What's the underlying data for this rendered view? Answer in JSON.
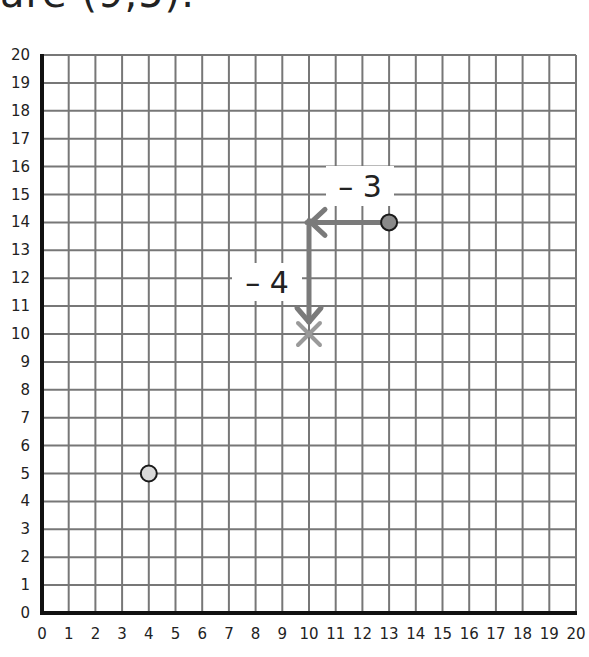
{
  "header": {
    "text": "are (9,5)."
  },
  "chart_data": {
    "type": "scatter",
    "title": "",
    "xlabel": "",
    "ylabel": "",
    "xlim": [
      0,
      20
    ],
    "ylim": [
      0,
      20
    ],
    "grid": true,
    "x_ticks": [
      "0",
      "1",
      "2",
      "3",
      "4",
      "5",
      "6",
      "7",
      "8",
      "9",
      "10",
      "11",
      "12",
      "13",
      "14",
      "15",
      "16",
      "17",
      "18",
      "19",
      "20"
    ],
    "y_ticks": [
      "0",
      "1",
      "2",
      "3",
      "4",
      "5",
      "6",
      "7",
      "8",
      "9",
      "10",
      "11",
      "12",
      "13",
      "14",
      "15",
      "16",
      "17",
      "18",
      "19",
      "20"
    ],
    "points": [
      {
        "name": "start-point",
        "x": 13,
        "y": 14,
        "color": "#8a8a8a"
      },
      {
        "name": "other-point",
        "x": 4,
        "y": 5,
        "color": "#d9d9d9"
      }
    ],
    "markers": [
      {
        "name": "result-cross",
        "x": 10,
        "y": 10,
        "symbol": "x",
        "color": "#9a9a9a"
      }
    ],
    "translations": [
      {
        "from": [
          13,
          14
        ],
        "to": [
          10,
          14
        ],
        "label": "– 3",
        "direction": "left"
      },
      {
        "from": [
          10,
          14
        ],
        "to": [
          10,
          10
        ],
        "label": "– 4",
        "direction": "down"
      }
    ],
    "annotations": [
      {
        "text": "– 3",
        "near": [
          12,
          15
        ]
      },
      {
        "text": "– 4",
        "near": [
          8.7,
          11.5
        ]
      }
    ],
    "colors": {
      "grid": "#777777",
      "axis": "#111111",
      "arrow": "#7a7a7a"
    }
  }
}
